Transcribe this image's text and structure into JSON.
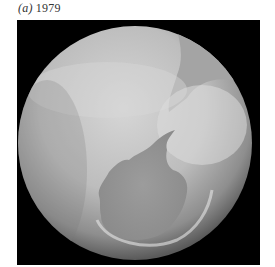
{
  "caption": {
    "panel_label": "(a)",
    "year": "1979"
  },
  "figure": {
    "colors": {
      "background": "#000000",
      "globe_light": "#cfcfcf",
      "globe_mid": "#a9a9a9",
      "land_dark": "#8f8f8f",
      "limb_dark": "#5e5e5e"
    }
  }
}
